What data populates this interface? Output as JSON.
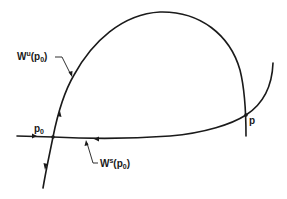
{
  "diagram": {
    "type": "phase-portrait",
    "colors": {
      "ink": "#1a1a1a",
      "background": "#ffffff"
    },
    "points": {
      "p0": {
        "label_main": "p",
        "label_sub": "0"
      },
      "p": {
        "label_main": "p"
      }
    },
    "labels": {
      "unstable_manifold": {
        "main": "W",
        "sup": "u",
        "arg_open": "(p",
        "arg_sub": "0",
        "arg_close": ")"
      },
      "stable_manifold": {
        "main": "W",
        "sup": "s",
        "arg_open": "(p",
        "arg_sub": "0",
        "arg_close": ")"
      }
    }
  }
}
